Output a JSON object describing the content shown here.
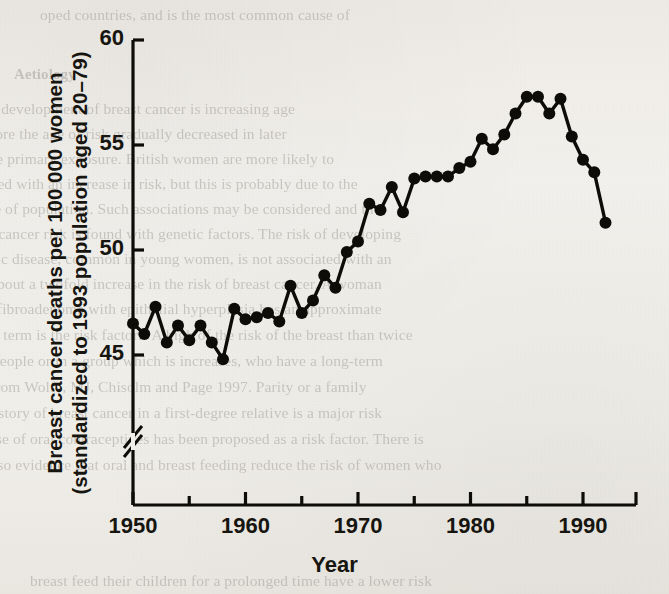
{
  "page": {
    "background_color": "#f1efea",
    "ink_color": "#17150f"
  },
  "figure": {
    "xaxis_title": "Year",
    "yaxis_title_line1": "Breast cancer deaths per 100 000 women",
    "yaxis_title_line2": "(standardized to 1993 population aged 20–79)",
    "axis_break_symbol": "//",
    "ytick_labels": [
      "60",
      "55",
      "50",
      "45"
    ],
    "xtick_labels": [
      "1950",
      "1960",
      "1970",
      "1980",
      "1990"
    ]
  },
  "chart_data": {
    "type": "line",
    "title": "",
    "subtitle": "",
    "xlabel": "Year",
    "ylabel": "Breast cancer deaths per 100 000 women (standardized to 1993 population aged 20–79)",
    "xlim": [
      1949,
      1992.5
    ],
    "ylim": [
      44.2,
      60
    ],
    "xticks": [
      1950,
      1960,
      1970,
      1980,
      1990
    ],
    "xminorticks": [
      1955,
      1965,
      1975,
      1985
    ],
    "yticks": [
      45,
      50,
      55,
      60
    ],
    "grid": false,
    "legend": null,
    "axis_break": {
      "axis": "y",
      "below": 45,
      "symbol": "//"
    },
    "marker": "filled-circle",
    "marker_color": "#0d0c09",
    "line_color": "#0d0c09",
    "x": [
      1950,
      1951,
      1952,
      1953,
      1954,
      1955,
      1956,
      1957,
      1958,
      1959,
      1960,
      1961,
      1962,
      1963,
      1964,
      1965,
      1966,
      1967,
      1968,
      1969,
      1970,
      1971,
      1972,
      1973,
      1974,
      1975,
      1976,
      1977,
      1978,
      1979,
      1980,
      1981,
      1982,
      1983,
      1984,
      1985,
      1986,
      1987,
      1988,
      1989,
      1990,
      1991,
      1992
    ],
    "values": [
      46.5,
      46.0,
      47.3,
      45.6,
      46.4,
      45.7,
      46.4,
      45.6,
      44.8,
      47.2,
      46.7,
      46.8,
      47.0,
      46.6,
      48.3,
      47.0,
      47.6,
      48.8,
      48.2,
      49.9,
      50.4,
      52.2,
      51.9,
      53.0,
      51.8,
      53.4,
      53.5,
      53.5,
      53.5,
      53.9,
      54.2,
      55.3,
      54.8,
      55.5,
      56.5,
      57.3,
      57.3,
      56.5,
      57.2,
      55.4,
      54.3,
      53.7,
      51.3
    ],
    "series": [
      {
        "name": "Breast cancer death rate",
        "values": [
          46.5,
          46.0,
          47.3,
          45.6,
          46.4,
          45.7,
          46.4,
          45.6,
          44.8,
          47.2,
          46.7,
          46.8,
          47.0,
          46.6,
          48.3,
          47.0,
          47.6,
          48.8,
          48.2,
          49.9,
          50.4,
          52.2,
          51.9,
          53.0,
          51.8,
          53.4,
          53.5,
          53.5,
          53.5,
          53.9,
          54.2,
          55.3,
          54.8,
          55.5,
          56.5,
          57.3,
          57.3,
          56.5,
          57.2,
          55.4,
          54.3,
          53.7,
          51.3
        ]
      }
    ]
  },
  "background_text": {
    "lines": [
      {
        "text": "oped countries, and is the most common cause of",
        "x": 40,
        "y": 6,
        "size": 15.5
      },
      {
        "text": "Aetiology",
        "x": 14,
        "y": 66,
        "size": 15,
        "bold": true
      },
      {
        "text": "r development of breast cancer is increasing age",
        "x": -8,
        "y": 100,
        "size": 15.5
      },
      {
        "text": "fore the age of risk gradually decreased in later",
        "x": -10,
        "y": 125,
        "size": 15.5
      },
      {
        "text": "the primary exposure. British women are more likely to",
        "x": -16,
        "y": 150,
        "size": 15.5
      },
      {
        "text": "ated with an increase in risk, but this is probably due to the",
        "x": -14,
        "y": 175,
        "size": 15.5
      },
      {
        "text": "se of population. Such associations may be considered and the",
        "x": -12,
        "y": 200,
        "size": 15.5
      },
      {
        "text": "t cancer risk is found with genetic factors. The risk of developing",
        "x": -10,
        "y": 225,
        "size": 15.5
      },
      {
        "text": "stic disease, common in young women, is not associated with an",
        "x": -14,
        "y": 250,
        "size": 15.5
      },
      {
        "text": "about a twofold increase in the risk of breast cancer. A woman",
        "x": -10,
        "y": 275,
        "size": 15.5
      },
      {
        "text": "a fibroadenoma with epithelial hyperplasia has an approximate",
        "x": -14,
        "y": 300,
        "size": 15.5
      },
      {
        "text": "at term is the risk factors. A high of the risk of the breast than twice",
        "x": -12,
        "y": 326,
        "size": 15.5
      },
      {
        "text": "people or in a group which is increases, who have a long-term",
        "x": -8,
        "y": 352,
        "size": 15.5
      },
      {
        "text": "from Wolfe, MJ, Chisolm and Page 1997. Parity or a family",
        "x": -10,
        "y": 378,
        "size": 15.5
      },
      {
        "text": "history of breast cancer in a first-degree relative is a major risk",
        "x": -14,
        "y": 404,
        "size": 15.5
      },
      {
        "text": "use of oral contraceptives has been proposed as a risk factor. There is",
        "x": -12,
        "y": 430,
        "size": 15.5
      },
      {
        "text": "also evidence that oral and breast feeding reduce the risk of women who",
        "x": -14,
        "y": 456,
        "size": 15.5
      },
      {
        "text": "breast feed their children for a prolonged time have a lower risk",
        "x": 30,
        "y": 572,
        "size": 15.5
      }
    ]
  }
}
